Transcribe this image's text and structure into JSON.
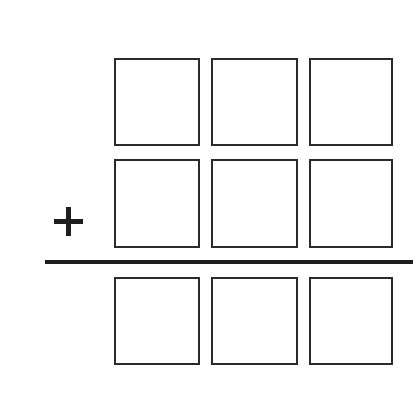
{
  "worksheet": {
    "title": "Vertical addition worksheet",
    "operator": {
      "name": "plus",
      "symbol": "+"
    },
    "rule": {
      "name": "sum-rule",
      "label": ""
    },
    "colors": {
      "background": "#ffffff",
      "box_stroke": "#2b2b2b",
      "ink": "#1e1e1e"
    },
    "rows": [
      {
        "role": "addend-1",
        "label": "",
        "cells": [
          {
            "place": "hundreds",
            "value": ""
          },
          {
            "place": "tens",
            "value": ""
          },
          {
            "place": "ones",
            "value": ""
          }
        ]
      },
      {
        "role": "addend-2",
        "label": "",
        "cells": [
          {
            "place": "hundreds",
            "value": ""
          },
          {
            "place": "tens",
            "value": ""
          },
          {
            "place": "ones",
            "value": ""
          }
        ]
      },
      {
        "role": "sum",
        "label": "",
        "cells": [
          {
            "place": "hundreds",
            "value": ""
          },
          {
            "place": "tens",
            "value": ""
          },
          {
            "place": "ones",
            "value": ""
          }
        ]
      }
    ]
  }
}
